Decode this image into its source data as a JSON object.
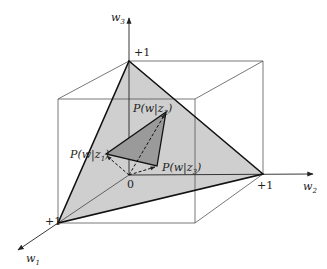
{
  "diagram": {
    "axes": {
      "w1": {
        "label": "w",
        "sub": "1",
        "tick": "+1"
      },
      "w2": {
        "label": "w",
        "sub": "2",
        "tick": "+1"
      },
      "w3": {
        "label": "w",
        "sub": "3",
        "tick": "+1"
      },
      "origin": "0"
    },
    "points": {
      "p1": {
        "label": "P(w|z",
        "sub": "1",
        "close": ")"
      },
      "p2": {
        "label": "P(w|z",
        "sub": "2",
        "close": ")"
      },
      "p3": {
        "label": "P(w|z",
        "sub": "3",
        "close": ")"
      }
    },
    "colors": {
      "simplex_fill": "#cfcfcf",
      "subsimplex_fill": "#9a9a9a",
      "line": "#222222",
      "cube": "#555555"
    }
  }
}
